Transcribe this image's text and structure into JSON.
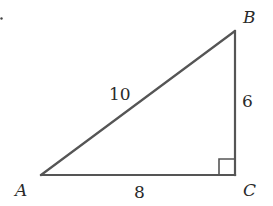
{
  "diagram": {
    "type": "right-triangle",
    "stroke_color": "#555555",
    "text_color": "#2a2a2a",
    "vertices": {
      "A": {
        "label": "A",
        "x": 41,
        "y": 175
      },
      "B": {
        "label": "B",
        "x": 235,
        "y": 31
      },
      "C": {
        "label": "C",
        "x": 235,
        "y": 175
      }
    },
    "sides": {
      "AB": {
        "label": "10"
      },
      "BC": {
        "label": "6"
      },
      "AC": {
        "label": "8"
      }
    },
    "right_angle_at": "C"
  }
}
